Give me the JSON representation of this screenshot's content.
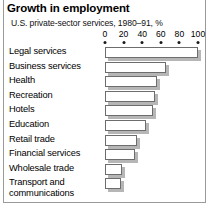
{
  "chart_data": {
    "type": "bar",
    "orientation": "horizontal",
    "title": "Growth in employment",
    "subtitle": "U.S. private-sector services, 1980–91, %",
    "xlabel": "",
    "ylabel": "",
    "xlim": [
      0,
      100
    ],
    "grid": false,
    "legend": null,
    "ticks": [
      0,
      20,
      40,
      60,
      80,
      100
    ],
    "tick_labels": [
      "0",
      "20",
      "40",
      "60",
      "80",
      "100"
    ],
    "categories": [
      "Legal services",
      "Business services",
      "Health",
      "Recreation",
      "Hotels",
      "Education",
      "Retail trade",
      "Financial services",
      "Wholesale trade",
      "Transport and communications"
    ],
    "values": [
      100,
      66,
      56,
      54,
      52,
      44,
      34,
      32,
      18,
      17
    ]
  },
  "colors": {
    "bar_fill": "#ffffff",
    "bar_outline": "#6d6d6d",
    "bar_shadow": "#b6b6b6",
    "frame": "#9a9a9a",
    "text": "#000000"
  }
}
